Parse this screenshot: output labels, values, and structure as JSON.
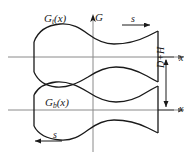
{
  "figure": {
    "labels": {
      "curve_top": "G",
      "curve_top_sub": "t",
      "curve_top_arg": "(x)",
      "curve_bottom": "G",
      "curve_bottom_sub": "b",
      "curve_bottom_arg": "(x)",
      "vertical_axis": "G",
      "axis_x_top": "x",
      "axis_x_bottom": "x",
      "direction_top": "s",
      "direction_bottom": "s",
      "dimension": "D+H"
    },
    "colors": {
      "curve": "#1a1a1a",
      "axis": "#808080",
      "dimension": "#1a1a1a",
      "background": "#ffffff"
    },
    "geometry": {
      "axis_top_y": 57,
      "axis_bottom_y": 110,
      "vertical_axis_x": 93,
      "vertical_axis_top": 17,
      "vertical_axis_bottom": 152,
      "shape_left_x": 34,
      "shape_right_x": 158,
      "dimension_line_x": 166,
      "dimension_top_y": 57,
      "dimension_bottom_y": 110,
      "arrow_top_s_x1": 122,
      "arrow_top_s_x2": 152,
      "arrow_top_s_y": 25,
      "arrow_bottom_s_x1": 62,
      "arrow_bottom_s_x2": 33,
      "arrow_bottom_s_y": 141
    }
  }
}
